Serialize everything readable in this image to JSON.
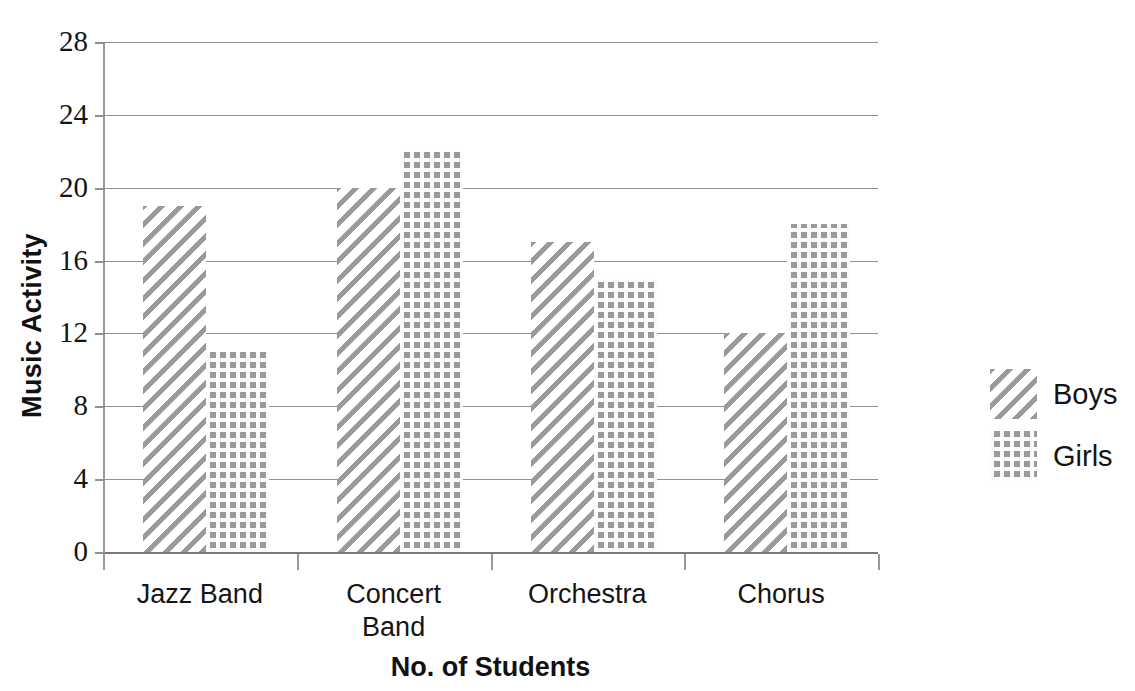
{
  "chart_data": {
    "type": "bar",
    "title": "",
    "xlabel": "No. of Students",
    "ylabel": "Music Activity",
    "categories": [
      "Jazz Band",
      "Concert\nBand",
      "Orchestra",
      "Chorus"
    ],
    "series": [
      {
        "name": "Boys",
        "values": [
          19,
          20,
          17,
          12
        ],
        "pattern": "diagonal-hatch",
        "color": "#9a9a9a"
      },
      {
        "name": "Girls",
        "values": [
          11,
          22,
          15,
          18
        ],
        "pattern": "dotted-grid",
        "color": "#9a9a9a"
      }
    ],
    "ylim": [
      0,
      28
    ],
    "yticks": [
      0,
      4,
      8,
      12,
      16,
      20,
      24,
      28
    ],
    "ytick_labels": [
      "0",
      "4",
      "8",
      "12",
      "16",
      "20",
      "24",
      "28"
    ],
    "grid": true,
    "legend_position": "right"
  },
  "axes": {
    "y_title": "Music Activity",
    "x_title": "No. of Students",
    "y_ticks": [
      {
        "value": 28,
        "label": "28"
      },
      {
        "value": 24,
        "label": "24"
      },
      {
        "value": 20,
        "label": "20"
      },
      {
        "value": 16,
        "label": "16"
      },
      {
        "value": 12,
        "label": "12"
      },
      {
        "value": 8,
        "label": "8"
      },
      {
        "value": 4,
        "label": "4"
      },
      {
        "value": 0,
        "label": "0"
      }
    ],
    "x_categories": [
      {
        "label": "Jazz Band"
      },
      {
        "label": "Concert\nBand"
      },
      {
        "label": "Orchestra"
      },
      {
        "label": "Chorus"
      }
    ]
  },
  "legend": {
    "items": [
      {
        "label": "Boys",
        "swatch": "diagonal-hatch-swatch"
      },
      {
        "label": "Girls",
        "swatch": "dotted-grid-swatch"
      }
    ]
  }
}
